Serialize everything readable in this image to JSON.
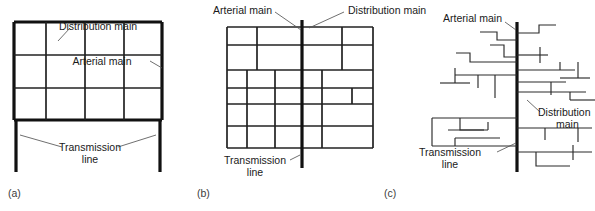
{
  "figure": {
    "colors": {
      "transmission_line": "#111111",
      "arterial_main": "#222222",
      "distribution_main": "#2b2b2b",
      "text": "#1a1a1a",
      "panel_label": "#3b3b3b",
      "background": "#ffffff"
    },
    "panels": [
      {
        "key": "a",
        "caption": "(a)",
        "layout_type": "grid",
        "labels": {
          "distribution_main": "Distribution main",
          "arterial_main": "Arterial main",
          "transmission_line_l1": "Transmission",
          "transmission_line_l2": "line"
        }
      },
      {
        "key": "b",
        "caption": "(b)",
        "layout_type": "grid-with-central-feeder",
        "labels": {
          "arterial_main": "Arterial main",
          "distribution_main": "Distribution main",
          "transmission_line_l1": "Transmission",
          "transmission_line_l2": "line"
        }
      },
      {
        "key": "c",
        "caption": "(c)",
        "layout_type": "branching-dead-end",
        "labels": {
          "arterial_main": "Arterial main",
          "distribution_main_l1": "Distribution",
          "distribution_main_l2": "main",
          "transmission_line_l1": "Transmission",
          "transmission_line_l2": "line"
        }
      }
    ]
  }
}
